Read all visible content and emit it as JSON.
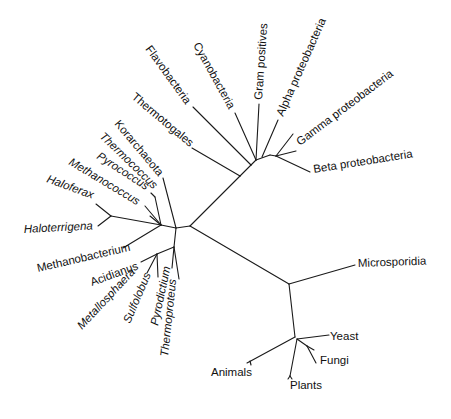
{
  "diagram": {
    "type": "unrooted-phylogenetic-tree",
    "line_color": "#1a1a1a",
    "background": "#ffffff",
    "groups": {
      "bacteria": {
        "taxa": [
          {
            "id": "flavobacteria",
            "label": "Flavobacteria",
            "italic": false
          },
          {
            "id": "cyanobacteria",
            "label": "Cyanobacteria",
            "italic": false
          },
          {
            "id": "gram-positives",
            "label": "Gram positives",
            "italic": false
          },
          {
            "id": "alpha-proteobacteria",
            "label": "Alpha proteobacteria",
            "italic": false
          },
          {
            "id": "gamma-proteobacteria",
            "label": "Gamma proteobacteria",
            "italic": false
          },
          {
            "id": "beta-proteobacteria",
            "label": "Beta proteobacteria",
            "italic": false
          },
          {
            "id": "thermotogales",
            "label": "Thermotogales",
            "italic": false
          }
        ]
      },
      "archaea": {
        "taxa": [
          {
            "id": "korarchaeota",
            "label": "Korarchaeota",
            "italic": false
          },
          {
            "id": "thermococcus",
            "label": "Thermococcus",
            "italic": true
          },
          {
            "id": "pyrococcus",
            "label": "Pyrococcus",
            "italic": true
          },
          {
            "id": "methanococcus",
            "label": "Methanococcus",
            "italic": true
          },
          {
            "id": "haloferax",
            "label": "Haloferax",
            "italic": true
          },
          {
            "id": "haloterrigena",
            "label": "Haloterrigena",
            "italic": true
          },
          {
            "id": "methanobacterium",
            "label": "Methanobacterium",
            "italic": false
          },
          {
            "id": "acidianus",
            "label": "Acidianus",
            "italic": false
          },
          {
            "id": "metallosphaera",
            "label": "Metallosphaera",
            "italic": true
          },
          {
            "id": "sulfolobus",
            "label": "Sulfolobus",
            "italic": true
          },
          {
            "id": "pyrodictium",
            "label": "Pyrodictium",
            "italic": true
          },
          {
            "id": "thermoproteus",
            "label": "Thermoproteus",
            "italic": true
          }
        ]
      },
      "eukarya": {
        "taxa": [
          {
            "id": "microsporidia",
            "label": "Microsporidia",
            "italic": false
          },
          {
            "id": "yeast",
            "label": "Yeast",
            "italic": false
          },
          {
            "id": "fungi",
            "label": "Fungi",
            "italic": false
          },
          {
            "id": "animals",
            "label": "Animals",
            "italic": false
          },
          {
            "id": "plants",
            "label": "Plants",
            "italic": false
          }
        ]
      }
    }
  }
}
